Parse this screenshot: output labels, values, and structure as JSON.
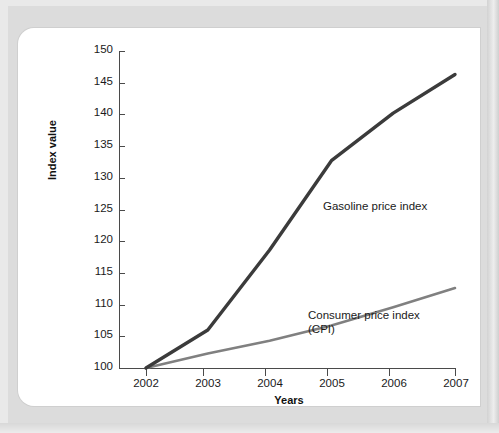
{
  "chart_data": {
    "type": "line",
    "title": "",
    "xlabel": "Years",
    "ylabel": "Index value",
    "categories": [
      "2002",
      "2003",
      "2004",
      "2005",
      "2006",
      "2007"
    ],
    "x": [
      2002,
      2003,
      2004,
      2005,
      2006,
      2007
    ],
    "xlim": [
      2002,
      2007
    ],
    "ylim": [
      100,
      150
    ],
    "yticks": [
      100,
      105,
      110,
      115,
      120,
      125,
      130,
      135,
      140,
      145,
      150
    ],
    "ytick_labels": [
      "100",
      "105",
      "110",
      "115",
      "120",
      "125",
      "130",
      "135",
      "140",
      "145",
      "150"
    ],
    "grid": false,
    "legend": "inline-annotations",
    "series": [
      {
        "name": "Gasoline price index",
        "color": "#3b3b3b",
        "width": 3.4,
        "values": [
          100,
          106.0,
          118.6,
          132.7,
          140.2,
          146.3
        ]
      },
      {
        "name": "Consumer price index (CPI)",
        "color": "#808080",
        "width": 2.6,
        "values": [
          100,
          102.3,
          104.3,
          106.7,
          109.6,
          112.6
        ]
      }
    ],
    "annotations": [
      {
        "text": "Gasoline price index",
        "series": "Gasoline price index"
      },
      {
        "text": "Consumer price index",
        "series": "Consumer price index (CPI)"
      },
      {
        "text": "(CPI)",
        "series": "Consumer price index (CPI)"
      }
    ]
  },
  "axis": {
    "y_title": "Index value",
    "x_title": "Years",
    "y_ticks": [
      "150",
      "145",
      "140",
      "135",
      "130",
      "125",
      "120",
      "115",
      "110",
      "105",
      "100"
    ],
    "x_ticks": [
      "2002",
      "2003",
      "2004",
      "2005",
      "2006",
      "2007"
    ]
  },
  "annotations": {
    "gasoline": "Gasoline price index",
    "cpi_line1": "Consumer price index",
    "cpi_line2": "(CPI)"
  },
  "colors": {
    "gasoline_line": "#3b3b3b",
    "cpi_line": "#808080",
    "axis": "#4a4a4a",
    "text": "#1a1a1a",
    "page_background": "#e9e9e9",
    "card_background": "#ffffff"
  }
}
